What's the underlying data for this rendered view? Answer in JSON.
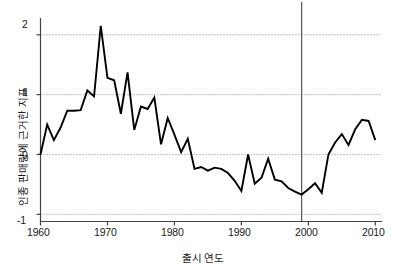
{
  "chart_data": {
    "type": "line",
    "title": "",
    "xlabel": "출시 연도",
    "ylabel": "인종 판매량에 근거한 지표",
    "xlim": [
      1960,
      2011
    ],
    "ylim": [
      -1.12,
      2.28
    ],
    "xticks": [
      1960,
      1970,
      1980,
      1990,
      2000,
      2010
    ],
    "xtick_labels": [
      "1960",
      "1970",
      "1980",
      "1990",
      "2000",
      "2010"
    ],
    "yticks": [
      -1,
      0,
      1,
      2
    ],
    "ytick_labels": [
      "-1",
      "0",
      "1",
      "2"
    ],
    "grid": "horizontal-dotted",
    "legend": "none",
    "series_color": "#000000",
    "annotation_line_color": "#555555",
    "annotations": [
      {
        "name": "vertical-marker-1999",
        "type": "vline",
        "x": 1999
      }
    ],
    "x": [
      1960,
      1961,
      1962,
      1963,
      1964,
      1965,
      1966,
      1967,
      1968,
      1969,
      1970,
      1971,
      1972,
      1973,
      1974,
      1975,
      1976,
      1977,
      1978,
      1979,
      1980,
      1981,
      1982,
      1983,
      1984,
      1985,
      1986,
      1987,
      1988,
      1989,
      1990,
      1991,
      1992,
      1993,
      1994,
      1995,
      1996,
      1997,
      1998,
      1999,
      2000,
      2001,
      2002,
      2003,
      2004,
      2005,
      2006,
      2007,
      2008,
      2009,
      2010
    ],
    "values": [
      0.0,
      0.5,
      0.24,
      0.45,
      0.73,
      0.73,
      0.74,
      1.07,
      0.97,
      2.15,
      1.28,
      1.24,
      0.68,
      1.37,
      0.41,
      0.8,
      0.76,
      0.95,
      0.17,
      0.61,
      0.33,
      0.04,
      0.26,
      -0.24,
      -0.21,
      -0.27,
      -0.22,
      -0.24,
      -0.31,
      -0.44,
      -0.61,
      0.0,
      -0.49,
      -0.39,
      -0.07,
      -0.42,
      -0.45,
      -0.56,
      -0.62,
      -0.67,
      -0.58,
      -0.48,
      -0.64,
      0.0,
      0.2,
      0.34,
      0.16,
      0.42,
      0.58,
      0.56,
      0.24
    ],
    "series": [
      {
        "name": "인종 판매량에 근거한 지표",
        "values": [
          0.0,
          0.5,
          0.24,
          0.45,
          0.73,
          0.73,
          0.74,
          1.07,
          0.97,
          2.15,
          1.28,
          1.24,
          0.68,
          1.37,
          0.41,
          0.8,
          0.76,
          0.95,
          0.17,
          0.61,
          0.33,
          0.04,
          0.26,
          -0.24,
          -0.21,
          -0.27,
          -0.22,
          -0.24,
          -0.31,
          -0.44,
          -0.61,
          0.0,
          -0.49,
          -0.39,
          -0.07,
          -0.42,
          -0.45,
          -0.56,
          -0.62,
          -0.67,
          -0.58,
          -0.48,
          -0.64,
          0.0,
          0.2,
          0.34,
          0.16,
          0.42,
          0.58,
          0.56,
          0.24
        ]
      }
    ]
  },
  "axes": {
    "x_title": "출시 연도",
    "y_title": "인종 판매량에 근거한 지표",
    "x_tick_labels": [
      "1960",
      "1970",
      "1980",
      "1990",
      "2000",
      "2010"
    ],
    "y_tick_labels": [
      "2",
      "1",
      "0",
      "-1"
    ]
  }
}
